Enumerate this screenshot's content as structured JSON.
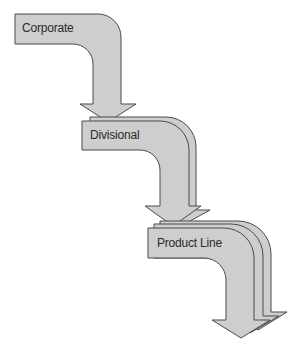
{
  "diagram": {
    "type": "cascading-arrows",
    "levels": [
      {
        "label": "Corporate",
        "arrow_layers": 1
      },
      {
        "label": "Divisional",
        "arrow_layers": 2
      },
      {
        "label": "Product Line",
        "arrow_layers": 3
      }
    ],
    "colors": {
      "fill": "#cecece",
      "stroke": "#4a4a4a",
      "text": "#2a2a2a"
    }
  }
}
